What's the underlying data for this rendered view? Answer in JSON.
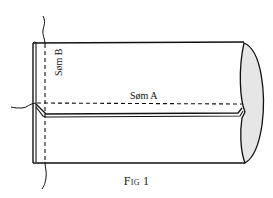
{
  "figure": {
    "caption": "Fig 1",
    "labels": {
      "seam_a": "Søm A",
      "seam_b": "Søm B"
    },
    "colors": {
      "line": "#111111",
      "shade": "#e6e6e6",
      "background": "#ffffff"
    }
  }
}
